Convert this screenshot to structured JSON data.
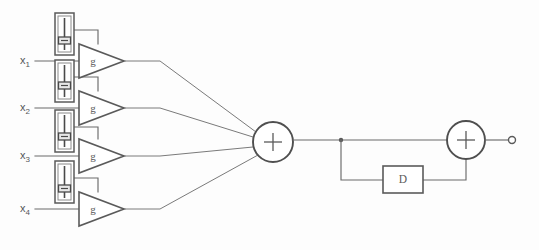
{
  "diagram": {
    "background_color": "#fdfdfd",
    "line_color": "#6b6b6b",
    "shape_color": "#5a5a5a",
    "canvas": {
      "width": 539,
      "height": 250
    },
    "inputs": [
      {
        "id": "x1",
        "label_base": "x",
        "label_sub": "1",
        "y": 61,
        "label_x": 20
      },
      {
        "id": "x2",
        "label_base": "x",
        "label_sub": "2",
        "y": 108,
        "label_x": 20
      },
      {
        "id": "x3",
        "label_base": "x",
        "label_sub": "3",
        "y": 156,
        "label_x": 20
      },
      {
        "id": "x4",
        "label_base": "x",
        "label_sub": "4",
        "y": 209,
        "label_x": 20
      }
    ],
    "gain_blocks": [
      {
        "id": "g1",
        "label": "g",
        "cx": 98,
        "cy": 61
      },
      {
        "id": "g2",
        "label": "g",
        "cx": 98,
        "cy": 108
      },
      {
        "id": "g3",
        "label": "g",
        "cx": 98,
        "cy": 156
      },
      {
        "id": "g4",
        "label": "g",
        "cx": 98,
        "cy": 209
      }
    ],
    "sliders": [
      {
        "id": "slider-1",
        "x": 55,
        "y": 13,
        "width": 19,
        "height": 42,
        "thumb_position_pct": 70
      },
      {
        "id": "slider-2",
        "x": 55,
        "y": 60,
        "width": 19,
        "height": 42,
        "thumb_position_pct": 65
      },
      {
        "id": "slider-3",
        "x": 55,
        "y": 110,
        "width": 19,
        "height": 42,
        "thumb_position_pct": 68
      },
      {
        "id": "slider-4",
        "x": 55,
        "y": 161,
        "width": 19,
        "height": 42,
        "thumb_position_pct": 70
      }
    ],
    "summing_nodes": [
      {
        "id": "sum-main",
        "label": "+",
        "cx": 273,
        "cy": 142,
        "r": 20
      },
      {
        "id": "sum-feedback",
        "label": "+",
        "cx": 466,
        "cy": 140,
        "r": 19
      }
    ],
    "delay_block": {
      "id": "delay",
      "label": "D",
      "x": 383,
      "y": 166,
      "width": 40,
      "height": 27
    },
    "output_terminal": {
      "id": "output",
      "cx": 512,
      "cy": 140,
      "r": 3.5
    },
    "junction_dot": {
      "id": "feedback-tap",
      "cx": 341,
      "cy": 140,
      "r": 2.2
    }
  }
}
